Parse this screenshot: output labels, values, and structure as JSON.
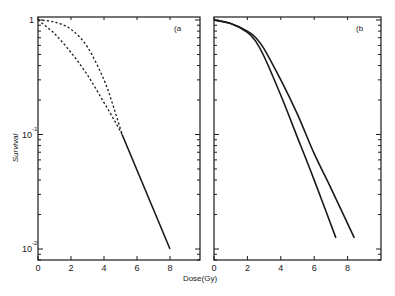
{
  "chart_data": [
    {
      "panel": "a",
      "type": "line",
      "title": "",
      "panel_label": "(a",
      "xlabel": "Dose(Gy)",
      "ylabel": "Survival",
      "xscale": "linear",
      "yscale": "log",
      "xlim": [
        0,
        9.8
      ],
      "ylim": [
        0.0075,
        1.05
      ],
      "xticks": [
        0,
        2,
        4,
        6,
        8
      ],
      "xtick_labels": [
        "0",
        "2",
        "4",
        "6",
        "8"
      ],
      "yticks": [
        1,
        0.1,
        0.01
      ],
      "ytick_labels": [
        "1",
        "10⁻¹",
        "10⁻²"
      ],
      "grid": false,
      "series": [
        {
          "name": "shouldered curve (dashed)",
          "style": "dashed",
          "x": [
            0,
            1,
            2,
            3,
            4,
            4.6,
            5.1
          ],
          "y": [
            1.0,
            0.96,
            0.83,
            0.58,
            0.3,
            0.17,
            0.1
          ]
        },
        {
          "name": "initial-slope curve (dashed)",
          "style": "dashed",
          "x": [
            0,
            1,
            2,
            3,
            4,
            4.6,
            5.1
          ],
          "y": [
            1.0,
            0.76,
            0.52,
            0.33,
            0.19,
            0.135,
            0.1
          ]
        },
        {
          "name": "common exponential tail (solid)",
          "style": "solid",
          "x": [
            5.1,
            8.0
          ],
          "y": [
            0.1,
            0.01
          ]
        }
      ]
    },
    {
      "panel": "b",
      "type": "line",
      "title": "",
      "panel_label": "(b",
      "xlabel": "Dose(Gy)",
      "ylabel": "",
      "xscale": "linear",
      "yscale": "log",
      "xlim": [
        0,
        10
      ],
      "ylim": [
        0.0075,
        1.05
      ],
      "xticks": [
        0,
        2,
        4,
        6,
        8
      ],
      "xtick_labels": [
        "0",
        "2",
        "4",
        "6",
        "8"
      ],
      "grid": false,
      "series": [
        {
          "name": "steeper curve",
          "style": "solid",
          "x": [
            0,
            1,
            2,
            2.5,
            3,
            4,
            5,
            6,
            7.3
          ],
          "y": [
            1.0,
            0.93,
            0.78,
            0.65,
            0.48,
            0.22,
            0.094,
            0.04,
            0.0125
          ]
        },
        {
          "name": "shallower curve",
          "style": "solid",
          "x": [
            0,
            1,
            2,
            2.5,
            3,
            4,
            5,
            6,
            7,
            8.4
          ],
          "y": [
            1.0,
            0.93,
            0.8,
            0.7,
            0.56,
            0.3,
            0.15,
            0.068,
            0.034,
            0.0125
          ]
        }
      ]
    }
  ],
  "figure": {
    "xlabel": "Dose(Gy)",
    "ylabel": "Survival",
    "panel_a_label": "(a",
    "panel_b_label": "(b",
    "ytick_1": "1",
    "ytick_01_base": "10",
    "ytick_01_exp": "-1",
    "ytick_001_base": "10",
    "ytick_001_exp": "-2",
    "xticks": [
      "0",
      "2",
      "4",
      "6",
      "8"
    ]
  }
}
